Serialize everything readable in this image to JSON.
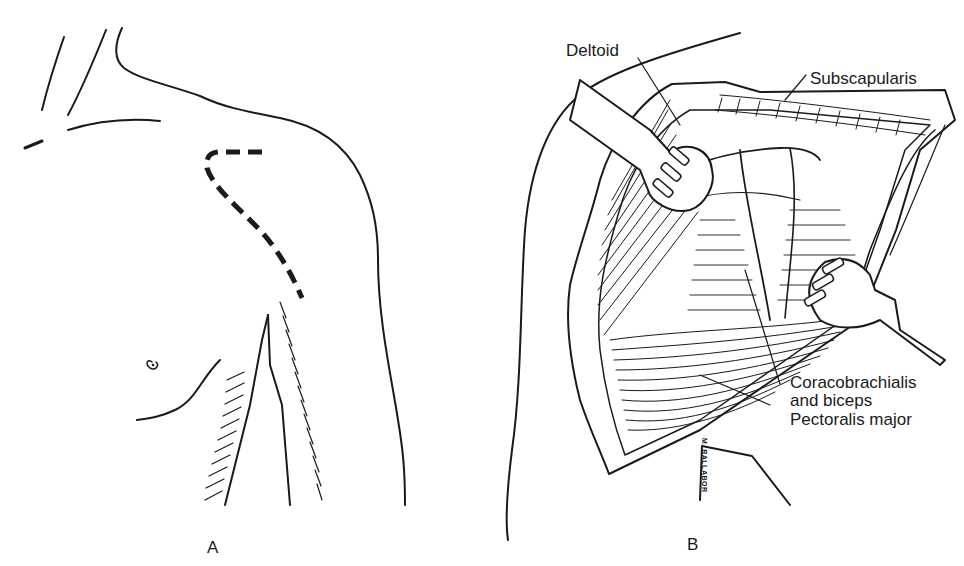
{
  "figure": {
    "panels": [
      {
        "id": "A",
        "label": "A",
        "description": "Anterior shoulder with dashed deltopectoral incision line"
      },
      {
        "id": "B",
        "label": "B",
        "description": "Retracted deltopectoral approach exposing underlying muscles"
      }
    ],
    "labels": {
      "deltoid": "Deltoid",
      "subscapularis": "Subscapularis",
      "coracobrachialis_line1": "Coracobrachialis",
      "coracobrachialis_line2": "and biceps",
      "pectoralis": "Pectoralis major"
    },
    "signature": "M. RALLABOR",
    "colors": {
      "ink": "#1a1a1a",
      "background": "#ffffff"
    }
  }
}
